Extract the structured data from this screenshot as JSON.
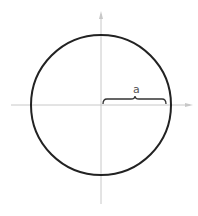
{
  "diagram": {
    "type": "circle-with-axes",
    "radius_label": "a",
    "colors": {
      "circle": "#222222",
      "axes": "#c8c8c8",
      "brace": "#333333",
      "label": "#555555",
      "background": "#ffffff"
    }
  }
}
